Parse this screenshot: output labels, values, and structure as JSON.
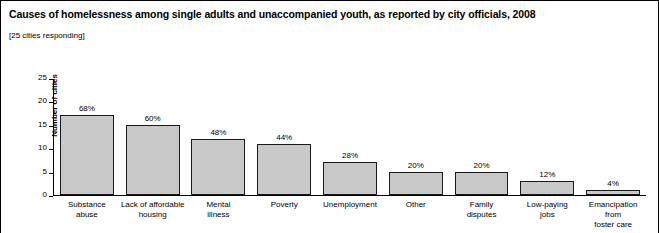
{
  "figure": {
    "title": "Causes of homelessness among single adults and unaccompanied youth, as reported by city officials, 2008",
    "subtitle": "[25 cities responding]",
    "bar_fill": "#c9c9c9",
    "bar_stroke": "#1a1a1a",
    "background": "#ffffff"
  },
  "chart_data": {
    "type": "bar",
    "title": "Causes of homelessness among single adults and unaccompanied youth, as reported by city officials, 2008",
    "subtitle": "[25 cities responding]",
    "xlabel": "",
    "ylabel": "Number of cities",
    "ylim": [
      0,
      25
    ],
    "yticks": [
      0,
      5,
      10,
      15,
      20,
      25
    ],
    "ytick_labels": [
      "0",
      "5",
      "10",
      "15",
      "20",
      "25"
    ],
    "grid": false,
    "legend": false,
    "categories": [
      "Substance abuse",
      "Lack of affordable housing",
      "Mental illness",
      "Poverty",
      "Unemployment",
      "Other",
      "Family disputes",
      "Low-paying jobs",
      "Emancipation from foster care"
    ],
    "category_lines": [
      [
        "Substance",
        "abuse"
      ],
      [
        "Lack of affordable",
        "housing"
      ],
      [
        "Mental",
        "illness"
      ],
      [
        "Poverty"
      ],
      [
        "Unemployment"
      ],
      [
        "Other"
      ],
      [
        "Family",
        "disputes"
      ],
      [
        "Low-paying",
        "jobs"
      ],
      [
        "Emancipation",
        "from",
        "foster care"
      ]
    ],
    "values": [
      17,
      15,
      12,
      11,
      7,
      5,
      5,
      3,
      1
    ],
    "data_labels": [
      "68%",
      "60%",
      "48%",
      "44%",
      "28%",
      "20%",
      "20%",
      "12%",
      "4%"
    ],
    "percent_values": [
      68,
      60,
      48,
      44,
      28,
      20,
      20,
      12,
      4
    ]
  }
}
